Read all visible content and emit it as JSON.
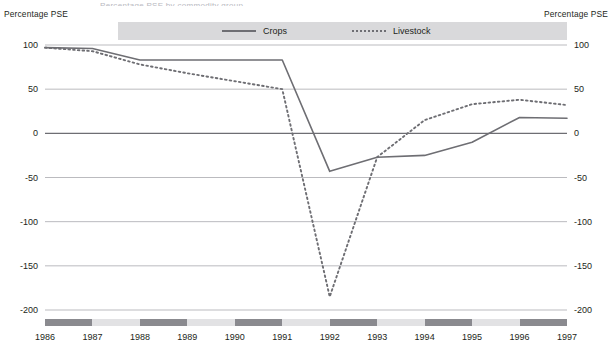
{
  "title_clipped": "Percentage PSE by commodity group",
  "axis": {
    "left_caption": "Percentage PSE",
    "right_caption": "Percentage PSE"
  },
  "legend": {
    "items": [
      {
        "label": "Crops",
        "style": "solid",
        "color": "#6e6e73"
      },
      {
        "label": "Livestock",
        "style": "dashed",
        "color": "#6e6e73"
      }
    ]
  },
  "colors": {
    "crops": "#6e6e73",
    "livestock": "#6e6e73",
    "gridline": "#a9a9ae",
    "zero_line": "#6e6e73",
    "band_dark": "#8a8a8f",
    "band_light": "#e2e2e4",
    "legend_band": "#d9d9db"
  },
  "chart_data": {
    "type": "line",
    "title": "Percentage PSE by commodity group",
    "xlabel": "",
    "ylabel": "Percentage PSE",
    "ylim": [
      -200,
      100
    ],
    "yticks": [
      100,
      50,
      0,
      -50,
      -100,
      -150,
      -200
    ],
    "ytick_labels": [
      "100",
      "50",
      "0",
      "-50",
      "-100",
      "-150",
      "-200"
    ],
    "x": [
      1986,
      1987,
      1988,
      1989,
      1990,
      1991,
      1992,
      1993,
      1994,
      1995,
      1996,
      1997
    ],
    "categories": [
      "1986",
      "1987",
      "1988",
      "1989",
      "1990",
      "1991",
      "1992",
      "1993",
      "1994",
      "1995",
      "1996",
      "1997"
    ],
    "grid": true,
    "legend_position": "top",
    "series": [
      {
        "name": "Crops",
        "style": "solid",
        "color": "#6e6e73",
        "values": [
          97,
          96,
          83,
          83,
          83,
          83,
          -43,
          -27,
          -25,
          -10,
          18,
          17
        ]
      },
      {
        "name": "Livestock",
        "style": "dashed",
        "color": "#6e6e73",
        "values": [
          97,
          93,
          78,
          68,
          59,
          50,
          -185,
          -27,
          15,
          33,
          38,
          32
        ]
      }
    ]
  }
}
